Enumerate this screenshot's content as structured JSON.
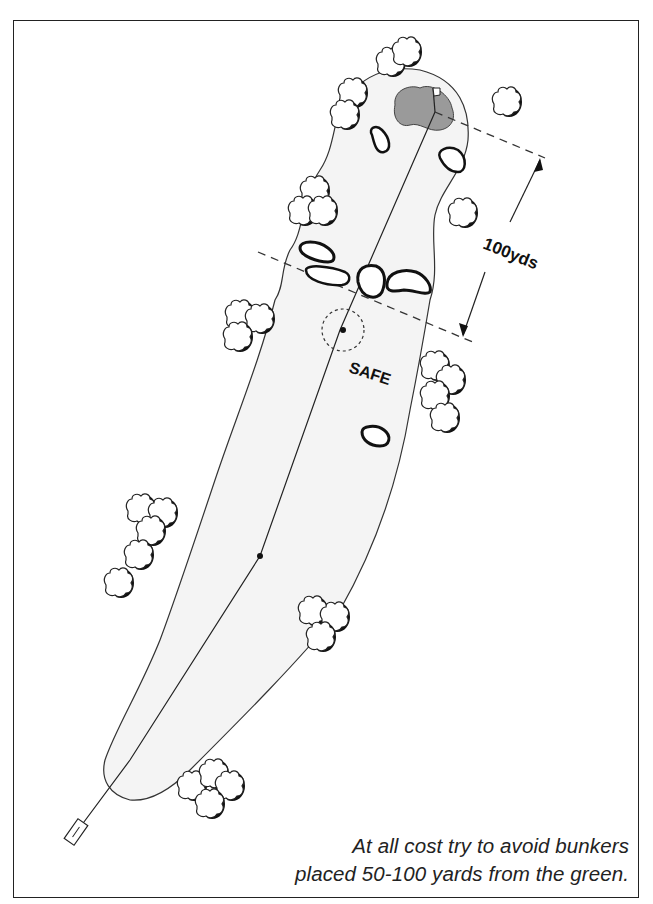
{
  "diagram": {
    "labels": {
      "distance": "100yds",
      "safe_zone": "SAFE"
    },
    "caption": {
      "line1": "At all cost try to avoid bunkers",
      "line2": "placed 50-100 yards from the green."
    },
    "elements": {
      "green": "putting green (grey)",
      "flag": "pin-flag",
      "tee": "tee box",
      "fairway": "fairway",
      "bunkers": 7,
      "tree_clusters": 10
    },
    "colors": {
      "green_fill": "#9a9a9a",
      "fairway_fill": "#f3f3f3",
      "line": "#222222",
      "tree_shadow": "#111111"
    }
  }
}
